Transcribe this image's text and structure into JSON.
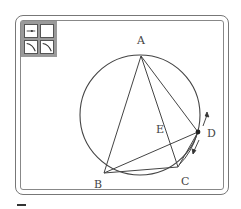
{
  "toolbar": {
    "tools": [
      {
        "name": "point-tool",
        "icon": "segment-point-icon"
      },
      {
        "name": "blank-tool",
        "icon": "blank-icon"
      },
      {
        "name": "arc-tool-left",
        "icon": "arc-left-icon"
      },
      {
        "name": "arc-tool-right",
        "icon": "arc-right-icon"
      }
    ]
  },
  "diagram": {
    "circle": {
      "cx": 140,
      "cy": 115,
      "r": 60
    },
    "points": {
      "A": {
        "label": "A",
        "x": 141,
        "y": 56
      },
      "B": {
        "label": "B",
        "x": 104,
        "y": 173
      },
      "C": {
        "label": "C",
        "x": 178,
        "y": 167
      },
      "D": {
        "label": "D",
        "x": 198,
        "y": 132
      },
      "E": {
        "label": "E",
        "x": 173,
        "y": 146
      }
    },
    "segments": [
      "AB",
      "AC",
      "AD",
      "BC",
      "BD",
      "CD"
    ],
    "movable_point": "D",
    "colors": {
      "stroke": "#444444",
      "frame": "#777777",
      "toolbar": "#9a9a9a"
    }
  }
}
